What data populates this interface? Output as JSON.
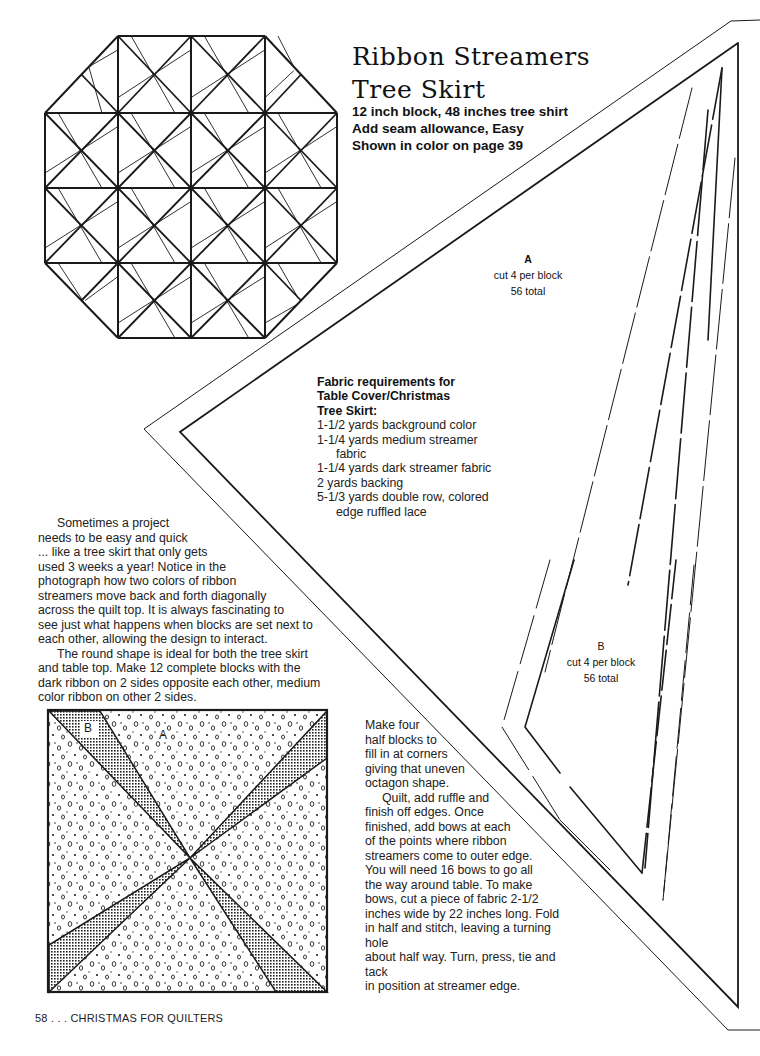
{
  "header": {
    "title_line1": "Ribbon Streamers",
    "title_line2": "Tree Skirt",
    "subtitle_lines": [
      "12 inch block, 48 inches tree shirt",
      "Add seam allowance, Easy",
      "Shown in color on page 39"
    ]
  },
  "template_a": {
    "letter": "A",
    "cut": "cut 4 per block",
    "total": "56 total"
  },
  "template_b": {
    "letter": "B",
    "cut": "cut 4 per block",
    "total": "56 total"
  },
  "fabric_requirements": {
    "heading_lines": [
      "Fabric requirements for",
      "Table Cover/Christmas",
      "Tree Skirt:"
    ],
    "items": [
      "1-1/2 yards background color",
      "1-1/4 yards medium streamer fabric",
      "1-1/4 yards dark streamer fabric",
      "2 yards backing",
      "5-1/3 yards double row, colored edge ruffled lace"
    ]
  },
  "intro": {
    "paragraph1_lines": [
      "Sometimes a project",
      "needs to be easy and quick",
      "... like a tree skirt that only gets",
      "used 3 weeks a year!  Notice in the",
      "photograph how two colors of ribbon",
      "streamers move back and forth diagonally",
      "across the quilt top.  It is always fascinating to",
      "see just what happens when blocks are set next to",
      "each other, allowing the design to interact."
    ],
    "paragraph2_lines": [
      "The round shape is ideal for both the tree skirt",
      "and table top.  Make 12 complete blocks with the",
      "dark ribbon on 2 sides opposite each other, medium",
      "color ribbon on other 2 sides."
    ]
  },
  "block_diagram": {
    "label_a": "A",
    "label_b": "B"
  },
  "instructions": {
    "paragraph1_lines": [
      "Make four",
      "half blocks to",
      "fill in at corners",
      "giving that uneven",
      "octagon shape."
    ],
    "paragraph2_lines": [
      "Quilt, add ruffle and",
      "finish off edges.  Once",
      "finished, add bows at each",
      "of the points where ribbon",
      "streamers come to outer edge.",
      "You will need 16 bows to go all",
      "the way around table.  To make",
      "bows, cut a piece of fabric 2-1/2",
      "inches wide by 22 inches long.  Fold",
      "in half and stitch, leaving a turning hole",
      "about half way.  Turn, press, tie and tack",
      "in position at streamer edge."
    ]
  },
  "footer": {
    "text": "58 . . . CHRISTMAS FOR QUILTERS"
  },
  "colors": {
    "ink": "#1a1a1a",
    "paper": "#ffffff"
  }
}
